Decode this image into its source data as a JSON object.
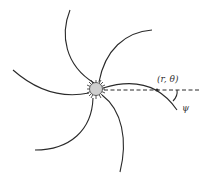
{
  "diagram": {
    "point_label": "(r, θ)",
    "angle_label": "ψ",
    "colors": {
      "stroke": "#2a2a2a",
      "center_fill": "#cfcfcf",
      "background": "#ffffff"
    },
    "arms_count": 6
  }
}
